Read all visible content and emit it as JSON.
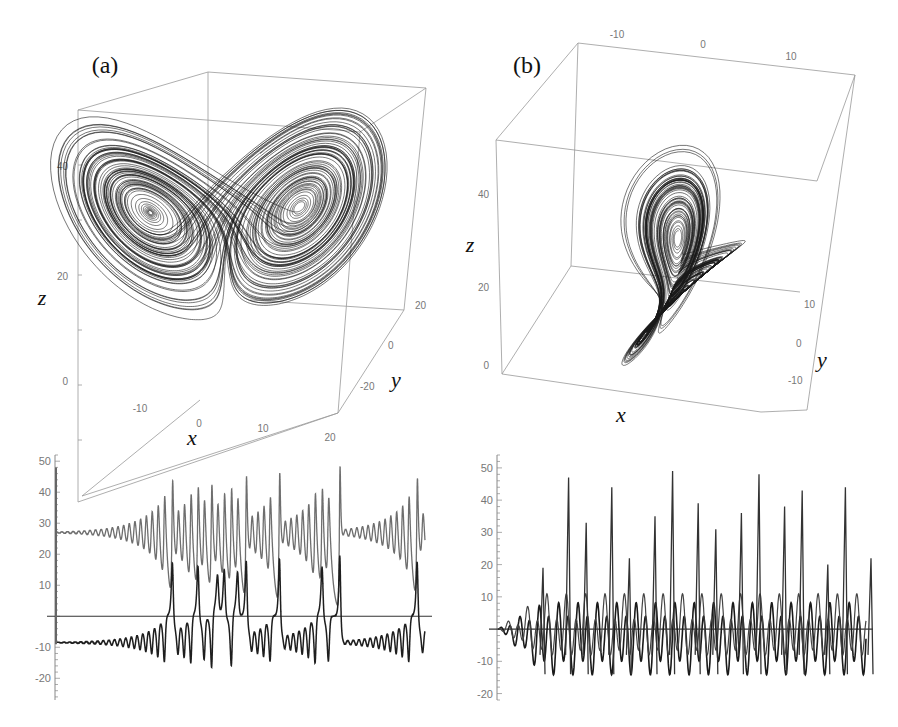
{
  "figure": {
    "panels": [
      {
        "id": "a",
        "label": "(a)",
        "attractor": {
          "type": "3d-line",
          "axes": {
            "x": "x",
            "y": "y",
            "z": "z"
          },
          "x_ticks": [
            "-10",
            "0",
            "10",
            "20"
          ],
          "y_ticks": [
            "-20",
            "0",
            "20"
          ],
          "z_ticks": [
            "0",
            "20",
            "40"
          ],
          "color": "#1a1a1a"
        },
        "timeseries": {
          "y_ticks": [
            "50",
            "40",
            "30",
            "20",
            "10",
            "-10",
            "-20"
          ],
          "ylim": [
            -27,
            52
          ]
        }
      },
      {
        "id": "b",
        "label": "(b)",
        "attractor": {
          "type": "3d-line",
          "axes": {
            "x": "x",
            "y": "y",
            "z": "z"
          },
          "x_ticks": [
            "-10",
            "0",
            "10"
          ],
          "y_ticks": [
            "-10",
            "0",
            "10"
          ],
          "z_ticks": [
            "0",
            "20",
            "40"
          ],
          "color": "#1a1a1a"
        },
        "timeseries": {
          "y_ticks": [
            "50",
            "40",
            "30",
            "20",
            "10",
            "-10",
            "-20"
          ],
          "ylim": [
            -22,
            54
          ]
        }
      }
    ]
  },
  "chart_data": [
    {
      "type": "line",
      "title": "(a) Lorenz attractor, 3D trajectory",
      "xlabel": "x",
      "ylabel": "y",
      "zlabel": "z",
      "xlim": [
        -20,
        20
      ],
      "ylim": [
        -25,
        25
      ],
      "zlim": [
        0,
        50
      ],
      "params": {
        "sigma": 10,
        "rho": 28,
        "beta": 2.6667
      },
      "grid": false
    },
    {
      "type": "line",
      "title": "(b) attractor, 3D trajectory",
      "xlabel": "x",
      "ylabel": "y",
      "zlabel": "z",
      "xlim": [
        -15,
        15
      ],
      "ylim": [
        -15,
        15
      ],
      "zlim": [
        0,
        50
      ],
      "grid": false
    },
    {
      "type": "line",
      "title": "(a) time series",
      "ylim": [
        -27,
        52
      ],
      "yticks": [
        -20,
        -10,
        10,
        20,
        30,
        40,
        50
      ],
      "series": [
        {
          "name": "upper (z-like)",
          "color": "#6e6e6e",
          "baseline": 27,
          "peak_values": [
            40,
            44,
            40,
            39,
            40,
            44,
            43,
            43,
            42,
            43,
            43,
            42,
            43
          ]
        },
        {
          "name": "lower (x-like)",
          "color": "#1e1e1e",
          "baseline": -9,
          "trough_values": [
            -20,
            -19,
            -21,
            -20,
            -22,
            -23,
            -23,
            -23,
            -24
          ]
        }
      ]
    },
    {
      "type": "line",
      "title": "(b) time series",
      "ylim": [
        -22,
        54
      ],
      "yticks": [
        -20,
        -10,
        10,
        20,
        30,
        40,
        50
      ],
      "series": [
        {
          "name": "spiking",
          "color": "#333333",
          "peak_values": [
            19,
            47,
            33,
            44,
            22,
            35,
            49,
            39,
            31,
            36,
            48,
            38,
            43,
            20,
            44,
            22
          ]
        },
        {
          "name": "oscillation",
          "color": "#1a1a1a",
          "range": [
            -18,
            12
          ]
        }
      ]
    }
  ]
}
